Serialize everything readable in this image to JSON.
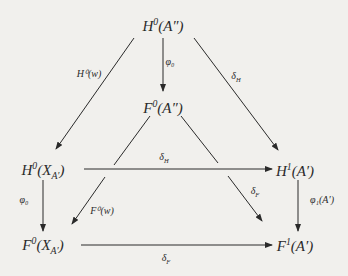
{
  "diagram": {
    "type": "commutative-diagram",
    "nodes": [
      {
        "id": "H0A2",
        "label": "H⁰(A″)",
        "x": 163,
        "y": 25
      },
      {
        "id": "F0A2",
        "label": "F⁰(A″)",
        "x": 163,
        "y": 107
      },
      {
        "id": "H0X",
        "label": "H⁰(X_A′)",
        "x": 43,
        "y": 170
      },
      {
        "id": "H1A1",
        "label": "H¹(A′)",
        "x": 295,
        "y": 170
      },
      {
        "id": "F0X",
        "label": "F⁰(X_A′)",
        "x": 43,
        "y": 245
      },
      {
        "id": "F1A1",
        "label": "F¹(A′)",
        "x": 295,
        "y": 245
      }
    ],
    "edges": [
      {
        "from": "H0A2",
        "to": "H0X",
        "label": "H⁰(w)"
      },
      {
        "from": "H0A2",
        "to": "F0A2",
        "label": "φ₀"
      },
      {
        "from": "H0A2",
        "to": "H1A1",
        "label": "δ_H"
      },
      {
        "from": "F0A2",
        "to": "F0X",
        "label": "F⁰(w)"
      },
      {
        "from": "F0A2",
        "to": "F1A1",
        "label": "δ_F"
      },
      {
        "from": "H0X",
        "to": "H1A1",
        "label": "δ_H"
      },
      {
        "from": "H0X",
        "to": "F0X",
        "label": "φ₀"
      },
      {
        "from": "H1A1",
        "to": "F1A1",
        "label": "φ₁(A′)"
      },
      {
        "from": "F0X",
        "to": "F1A1",
        "label": "δ_F"
      }
    ]
  },
  "labels": {
    "n_H0A2_base": "H",
    "n_H0A2_sup": "0",
    "n_H0A2_arg": "(A″)",
    "n_F0A2_base": "F",
    "n_F0A2_sup": "0",
    "n_F0A2_arg": "(A″)",
    "n_H0X_base": "H",
    "n_H0X_sup": "0",
    "n_H0X_argL": "(X",
    "n_H0X_sub": "A′",
    "n_H0X_argR": ")",
    "n_H1A1_base": "H",
    "n_H1A1_sup": "1",
    "n_H1A1_arg": "(A′)",
    "n_F0X_base": "F",
    "n_F0X_sup": "0",
    "n_F0X_argL": "(X",
    "n_F0X_sub": "A′",
    "n_F0X_argR": ")",
    "n_F1A1_base": "F",
    "n_F1A1_sup": "1",
    "n_F1A1_arg": "(A′)",
    "e_H0w": "H⁰(w)",
    "e_phi0_top": "φ₀",
    "e_dH_right": "δ",
    "e_dH_right_sub": "H",
    "e_F0w": "F⁰(w)",
    "e_dF_diag": "δ",
    "e_dF_diag_sub": "F",
    "e_dH_horiz": "δ",
    "e_dH_horiz_sub": "H",
    "e_phi0_left": "φ₀",
    "e_phi1": "φ₁(A′)",
    "e_dF_bottom": "δ",
    "e_dF_bottom_sub": "F"
  }
}
